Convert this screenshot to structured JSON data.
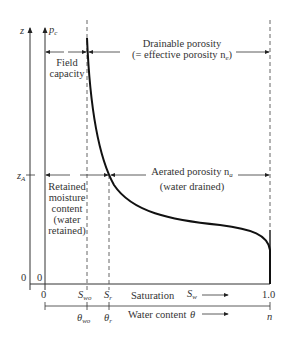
{
  "diagram": {
    "axes": {
      "left_axis_label": "z",
      "pressure_axis_label": "p",
      "pressure_axis_sub": "c",
      "z_marker_label": "z",
      "z_marker_sub": "A",
      "origin_z": "0",
      "origin_pc": "0"
    },
    "regions": {
      "field_capacity": [
        "Field",
        "capacity"
      ],
      "drainable_porosity_line1": "Drainable porosity",
      "drainable_porosity_line2": "(= effective porosity n",
      "drainable_porosity_sub": "e",
      "drainable_porosity_close": ")",
      "aerated_porosity_line1": "Aerated porosity n",
      "aerated_porosity_sub": "a",
      "aerated_porosity_line2": "(water drained)",
      "retained_moisture": [
        "Retained",
        "moisture",
        "content",
        "(water",
        "retained)"
      ]
    },
    "saturation_scale": {
      "zero": "0",
      "swo": "S",
      "swo_sub": "wo",
      "sr": "S",
      "sr_sub": "r",
      "label": "Saturation",
      "sw": "S",
      "sw_sub": "w",
      "one": "1.0"
    },
    "water_content_scale": {
      "theta_wo": "θ",
      "theta_wo_sub": "wo",
      "theta_r": "θ",
      "theta_r_sub": "r",
      "label": "Water content",
      "theta": "θ",
      "n": "n"
    }
  }
}
